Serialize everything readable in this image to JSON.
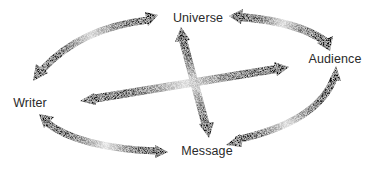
{
  "diagram": {
    "type": "communication-relationship-diagram",
    "nodes": [
      {
        "id": "universe",
        "label": "Universe",
        "x": 198,
        "y": 18
      },
      {
        "id": "audience",
        "label": "Audience",
        "x": 335,
        "y": 59
      },
      {
        "id": "writer",
        "label": "Writer",
        "x": 30,
        "y": 103
      },
      {
        "id": "message",
        "label": "Message",
        "x": 207,
        "y": 151
      }
    ],
    "edges": [
      {
        "from": "writer",
        "to": "universe",
        "style": "curved-double-arrow"
      },
      {
        "from": "universe",
        "to": "audience",
        "style": "curved-double-arrow"
      },
      {
        "from": "audience",
        "to": "message",
        "style": "curved-double-arrow"
      },
      {
        "from": "writer",
        "to": "message",
        "style": "curved-double-arrow"
      },
      {
        "from": "universe",
        "to": "message",
        "style": "straight-double-arrow"
      },
      {
        "from": "writer",
        "to": "audience",
        "style": "straight-double-arrow"
      }
    ],
    "colors": {
      "arrow_dark": "#151515",
      "arrow_light": "#d8d8d8",
      "text": "#2a2a2a",
      "background": "#ffffff"
    }
  }
}
